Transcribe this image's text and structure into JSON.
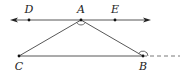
{
  "diagram": {
    "colors": {
      "stroke": "#444444",
      "point": "#111111",
      "label": "#222222",
      "background": "#ffffff"
    },
    "points": [
      {
        "id": "D",
        "label": "D",
        "x": 29,
        "y": 20,
        "label_x": 29,
        "label_y": 13
      },
      {
        "id": "A",
        "label": "A",
        "x": 81,
        "y": 20,
        "label_x": 81,
        "label_y": 13
      },
      {
        "id": "E",
        "label": "E",
        "x": 115,
        "y": 20,
        "label_x": 115,
        "label_y": 13
      },
      {
        "id": "C",
        "label": "C",
        "x": 19,
        "y": 56,
        "label_x": 19,
        "label_y": 70
      },
      {
        "id": "B",
        "label": "B",
        "x": 143,
        "y": 56,
        "label_x": 143,
        "label_y": 70
      }
    ],
    "line_DE": {
      "x1": 10,
      "y1": 20,
      "x2": 150,
      "y2": 20,
      "arrows": "both"
    },
    "segments": [
      {
        "name": "AC",
        "from": "A",
        "to": "C"
      },
      {
        "name": "AB",
        "from": "A",
        "to": "B"
      },
      {
        "name": "CB",
        "from": "C",
        "to": "B"
      }
    ],
    "extension": {
      "name": "B-extension",
      "x1": 143,
      "y1": 56,
      "x2": 180,
      "y2": 56,
      "style": "dashed"
    },
    "angle_marks": [
      {
        "at": "A",
        "description": "angle CAB arc"
      },
      {
        "at": "B",
        "description": "exterior angle at B arc"
      }
    ]
  }
}
